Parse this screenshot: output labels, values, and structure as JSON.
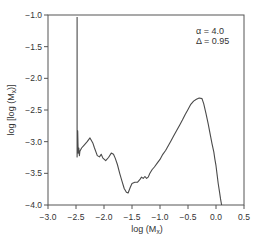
{
  "chart_data": {
    "type": "line",
    "title": "",
    "xlabel": "log (M_x)",
    "ylabel": "log [log (M_x)]",
    "xlim": [
      -3.0,
      0.5
    ],
    "ylim": [
      -4.0,
      -1.0
    ],
    "grid": false,
    "legend": null,
    "x_ticks": [
      -3.0,
      -2.5,
      -2.0,
      -1.5,
      -1.0,
      -0.5,
      0.0,
      0.5
    ],
    "x_tick_labels": [
      "−3.0",
      "−2.5",
      "−2.0",
      "−1.5",
      "−1.0",
      "−0.5",
      "0.0",
      "0.5"
    ],
    "y_ticks": [
      -1.0,
      -1.5,
      -2.0,
      -2.5,
      -3.0,
      -3.5,
      -4.0
    ],
    "y_tick_labels": [
      "−1.0",
      "−1.5",
      "−2.0",
      "−2.5",
      "−3.0",
      "−3.5",
      "−4.0"
    ],
    "annotations": [
      {
        "text": "α = 4.0",
        "x": -0.1,
        "y": -1.17
      },
      {
        "text": "Δ = 0.95",
        "x": -0.1,
        "y": -1.33
      }
    ],
    "series": [
      {
        "name": "log[log(Mx)]",
        "x": [
          -2.48,
          -2.48,
          -2.47,
          -2.46,
          -2.45,
          -2.44,
          -2.43,
          -2.4,
          -2.35,
          -2.3,
          -2.25,
          -2.2,
          -2.17,
          -2.12,
          -2.08,
          -2.05,
          -2.02,
          -1.97,
          -1.92,
          -1.87,
          -1.83,
          -1.8,
          -1.76,
          -1.72,
          -1.68,
          -1.64,
          -1.6,
          -1.57,
          -1.53,
          -1.5,
          -1.45,
          -1.4,
          -1.36,
          -1.33,
          -1.3,
          -1.27,
          -1.24,
          -1.21,
          -1.18,
          -1.14,
          -1.1,
          -1.05,
          -1.0,
          -0.95,
          -0.9,
          -0.85,
          -0.8,
          -0.75,
          -0.7,
          -0.65,
          -0.6,
          -0.55,
          -0.5,
          -0.45,
          -0.4,
          -0.35,
          -0.3,
          -0.25,
          -0.22,
          -0.18,
          -0.14,
          -0.1,
          -0.07,
          -0.04,
          -0.02,
          0.0,
          0.02,
          0.04,
          0.06,
          0.08,
          0.1
        ],
        "y": [
          -1.03,
          -3.24,
          -2.83,
          -3.18,
          -3.1,
          -3.22,
          -3.15,
          -3.1,
          -3.05,
          -3.0,
          -2.94,
          -3.02,
          -3.1,
          -3.22,
          -3.24,
          -3.2,
          -3.26,
          -3.3,
          -3.25,
          -3.18,
          -3.2,
          -3.26,
          -3.36,
          -3.5,
          -3.62,
          -3.74,
          -3.8,
          -3.81,
          -3.72,
          -3.66,
          -3.64,
          -3.64,
          -3.6,
          -3.56,
          -3.58,
          -3.55,
          -3.58,
          -3.56,
          -3.5,
          -3.44,
          -3.4,
          -3.34,
          -3.28,
          -3.2,
          -3.14,
          -3.06,
          -2.98,
          -2.9,
          -2.82,
          -2.74,
          -2.66,
          -2.57,
          -2.49,
          -2.41,
          -2.36,
          -2.33,
          -2.31,
          -2.32,
          -2.4,
          -2.55,
          -2.72,
          -2.9,
          -3.04,
          -3.16,
          -3.28,
          -3.38,
          -3.52,
          -3.66,
          -3.78,
          -3.9,
          -4.0
        ]
      }
    ]
  },
  "colors": {
    "line": "#4a4a4a",
    "axis": "#555555",
    "text": "#333333",
    "background": "#ffffff"
  }
}
